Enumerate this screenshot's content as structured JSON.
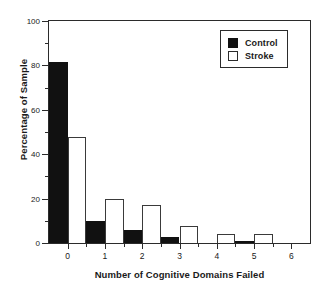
{
  "chart_data": {
    "type": "bar",
    "title": "",
    "xlabel": "Number of Cognitive Domains Failed",
    "ylabel": "Percentage of Sample",
    "categories": [
      "0",
      "1",
      "2",
      "3",
      "4",
      "5",
      "6"
    ],
    "series": [
      {
        "name": "Control",
        "values": [
          81.5,
          10.0,
          6.0,
          2.5,
          0.0,
          0.5,
          0.0
        ],
        "color": "#111111",
        "fill": "solid"
      },
      {
        "name": "Stroke",
        "values": [
          47.8,
          20.0,
          17.0,
          7.5,
          4.0,
          4.0,
          0.0
        ],
        "color": "#ffffff",
        "fill": "open"
      }
    ],
    "ylim": [
      0,
      100
    ],
    "xlim": [
      -0.5,
      6.5
    ],
    "y_ticks": [
      0,
      20,
      40,
      60,
      80,
      100
    ],
    "y_minor_ticks": [
      10,
      30,
      50,
      70,
      90
    ],
    "x_ticks": [
      0,
      1,
      2,
      3,
      4,
      5,
      6
    ],
    "x_minor_ticks": [
      0.5,
      1.5,
      2.5,
      3.5,
      4.5,
      5.5
    ],
    "grid": false,
    "legend_position": "top-right",
    "legend_entries": [
      "Control",
      "Stroke"
    ]
  },
  "legend": {
    "items": [
      {
        "label": "Control",
        "swatch": "filled-square-icon"
      },
      {
        "label": "Stroke",
        "swatch": "open-square-icon"
      }
    ]
  },
  "axes": {
    "y_tick_labels": [
      "0",
      "20",
      "40",
      "60",
      "80",
      "100"
    ],
    "x_tick_labels": [
      "0",
      "1",
      "2",
      "3",
      "4",
      "5",
      "6"
    ]
  }
}
